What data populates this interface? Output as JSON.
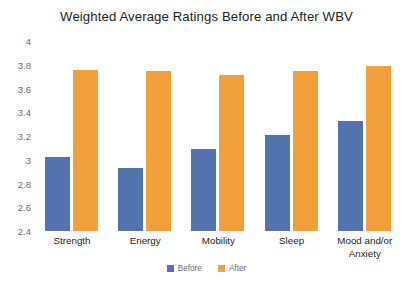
{
  "chart_data": {
    "type": "bar",
    "title": "Weighted Average Ratings Before and After WBV",
    "xlabel": "",
    "ylabel": "",
    "ylim": [
      2.4,
      4
    ],
    "ytick_step": 0.2,
    "yticks": [
      "4",
      "3.8",
      "3.6",
      "3.4",
      "3.2",
      "3",
      "2.8",
      "2.6",
      "2.4"
    ],
    "ytick_values": [
      4,
      3.8,
      3.6,
      3.4,
      3.2,
      3,
      2.8,
      2.6,
      2.4
    ],
    "grid": false,
    "legend_position": "bottom",
    "categories": [
      "Strength",
      "Energy",
      "Mobility",
      "Sleep",
      "Mood and/or Anxiety"
    ],
    "series": [
      {
        "name": "Before",
        "color": "#5273AE",
        "values": [
          3.02,
          2.93,
          3.09,
          3.21,
          3.33
        ]
      },
      {
        "name": "After",
        "color": "#F2A03C",
        "values": [
          3.76,
          3.75,
          3.71,
          3.75,
          3.79
        ]
      }
    ]
  }
}
